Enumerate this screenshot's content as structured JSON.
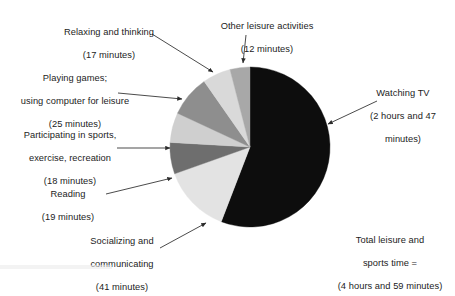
{
  "chart_data": {
    "type": "pie",
    "title": "",
    "unit": "minutes",
    "total_label": "Total leisure and sports time =",
    "total_value_label": "(4 hours and 59 minutes)",
    "total_minutes": 299,
    "start_angle_deg": 0,
    "direction": "clockwise",
    "legend": "none",
    "grid": false,
    "categories": [
      "Watching TV",
      "Socializing and communicating",
      "Reading",
      "Participating in sports, exercise, recreation",
      "Playing games; using computer for leisure",
      "Relaxing and thinking",
      "Other leisure activities"
    ],
    "values": [
      167,
      41,
      19,
      18,
      25,
      17,
      12
    ],
    "value_labels": [
      "(2 hours and 47 minutes)",
      "(41 minutes)",
      "(19 minutes)",
      "(18 minutes)",
      "(25 minutes)",
      "(17 minutes)",
      "(12 minutes)"
    ],
    "colors": [
      "#0d0d0d",
      "#e3e3e3",
      "#6e6e6e",
      "#cfcfcf",
      "#8e8e8e",
      "#d9d9d9",
      "#a8a8a8"
    ]
  },
  "labels": {
    "watching_tv": {
      "l1": "Watching TV",
      "l2": "(2 hours and 47",
      "l3": "minutes)"
    },
    "total": {
      "l1": "Total leisure and",
      "l2": "sports time =",
      "l3": "(4 hours and 59 minutes)"
    },
    "socializing": {
      "l1": "Socializing and",
      "l2": "communicating",
      "l3": "(41 minutes)"
    },
    "reading": {
      "l1": "Reading",
      "l2": "(19 minutes)"
    },
    "sports": {
      "l1": "Participating in sports,",
      "l2": "exercise, recreation",
      "l3": "(18 minutes)"
    },
    "games": {
      "l1": "Playing games;",
      "l2": "using computer for leisure",
      "l3": "(25 minutes)"
    },
    "relaxing": {
      "l1": "Relaxing and thinking",
      "l2": "(17 minutes)"
    },
    "other": {
      "l1": "Other leisure activities",
      "l2": "(12 minutes)"
    }
  }
}
